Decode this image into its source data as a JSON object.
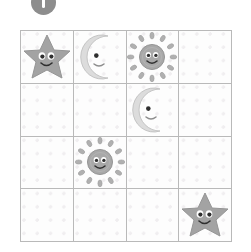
{
  "badge": {
    "icon": "circle-number-badge",
    "label": "1",
    "color": "#8d8d8d",
    "mark_color": "#ffffff"
  },
  "grid": {
    "rows": 4,
    "columns": 4,
    "line_color": "#b9b9b9",
    "background_color": "#fdfdfd",
    "dot_color": "#f0eef0",
    "cells": [
      {
        "row": 1,
        "col": 1,
        "icon": "smiling-star",
        "name": "star"
      },
      {
        "row": 1,
        "col": 2,
        "icon": "smiling-crescent-moon",
        "name": "moon"
      },
      {
        "row": 1,
        "col": 3,
        "icon": "smiling-sun",
        "name": "sun"
      },
      {
        "row": 1,
        "col": 4,
        "icon": "none",
        "name": "empty"
      },
      {
        "row": 2,
        "col": 1,
        "icon": "none",
        "name": "empty"
      },
      {
        "row": 2,
        "col": 2,
        "icon": "none",
        "name": "empty"
      },
      {
        "row": 2,
        "col": 3,
        "icon": "smiling-crescent-moon",
        "name": "moon"
      },
      {
        "row": 2,
        "col": 4,
        "icon": "none",
        "name": "empty"
      },
      {
        "row": 3,
        "col": 1,
        "icon": "none",
        "name": "empty"
      },
      {
        "row": 3,
        "col": 2,
        "icon": "smiling-sun",
        "name": "sun"
      },
      {
        "row": 3,
        "col": 3,
        "icon": "none",
        "name": "empty"
      },
      {
        "row": 3,
        "col": 4,
        "icon": "none",
        "name": "empty"
      },
      {
        "row": 4,
        "col": 1,
        "icon": "none",
        "name": "empty"
      },
      {
        "row": 4,
        "col": 2,
        "icon": "none",
        "name": "empty"
      },
      {
        "row": 4,
        "col": 3,
        "icon": "none",
        "name": "empty"
      },
      {
        "row": 4,
        "col": 4,
        "icon": "smiling-star",
        "name": "star"
      }
    ]
  },
  "colors": {
    "star_fill": "#a3a3a3",
    "star_stroke": "#8f8f8f",
    "moon_fill": "#d8d8d8",
    "moon_stroke": "#bdbdbd",
    "sun_fill": "#a8a8a8",
    "sun_stroke": "#959595",
    "sun_ray": "#b0b0b0",
    "face": "#3a3a3a"
  }
}
